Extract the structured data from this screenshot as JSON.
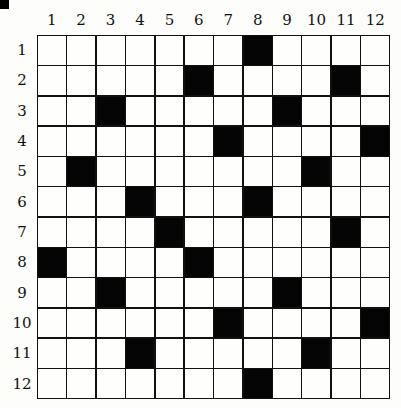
{
  "puzzle": {
    "rows": 12,
    "cols": 12,
    "column_labels": [
      "1",
      "2",
      "3",
      "4",
      "5",
      "6",
      "7",
      "8",
      "9",
      "10",
      "11",
      "12"
    ],
    "row_labels": [
      "1",
      "2",
      "3",
      "4",
      "5",
      "6",
      "7",
      "8",
      "9",
      "10",
      "11",
      "12"
    ],
    "black_cells": [
      [
        1,
        8
      ],
      [
        2,
        6
      ],
      [
        2,
        11
      ],
      [
        3,
        3
      ],
      [
        3,
        9
      ],
      [
        4,
        7
      ],
      [
        4,
        12
      ],
      [
        5,
        2
      ],
      [
        5,
        10
      ],
      [
        6,
        4
      ],
      [
        6,
        8
      ],
      [
        7,
        5
      ],
      [
        7,
        11
      ],
      [
        8,
        1
      ],
      [
        8,
        6
      ],
      [
        9,
        3
      ],
      [
        9,
        9
      ],
      [
        10,
        7
      ],
      [
        10,
        12
      ],
      [
        11,
        4
      ],
      [
        11,
        10
      ],
      [
        12,
        8
      ]
    ],
    "colors": {
      "black": "#050505",
      "white": "#fefefc",
      "grid_line": "#111111"
    }
  }
}
